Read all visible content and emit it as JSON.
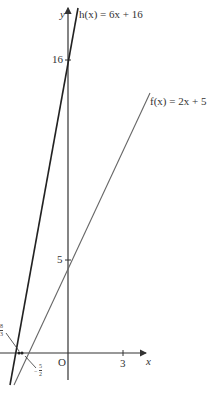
{
  "figure": {
    "axes": {
      "x_label": "x",
      "y_label": "y",
      "origin_label": "O",
      "x_ticks": [
        {
          "value": 3,
          "label": "3"
        }
      ],
      "y_ticks": [
        {
          "value": 5,
          "label": "5"
        },
        {
          "value": 16,
          "label": "16"
        }
      ]
    },
    "lines": [
      {
        "name": "h",
        "label": "h(x) = 6x + 16",
        "slope": 6,
        "intercept": 16,
        "color": "#222222"
      },
      {
        "name": "f",
        "label": "f(x) = 2x + 5",
        "slope": 2,
        "intercept": 5,
        "color": "#666666"
      }
    ],
    "annotations": [
      {
        "label": "−8/3",
        "num": "8",
        "den": "3",
        "sign": "−",
        "meaning": "x-intercept of h"
      },
      {
        "label": "−5/2",
        "num": "5",
        "den": "2",
        "sign": "−",
        "meaning": "x-intercept of f"
      }
    ],
    "colors": {
      "axis": "#333333",
      "h_line": "#222222",
      "f_line": "#666666"
    }
  },
  "labels": {
    "h": "h(x) = 6x + 16",
    "f": "f(x) = 2x + 5",
    "y_axis": "y",
    "x_axis": "x",
    "origin": "O",
    "tick_3": "3",
    "tick_5": "5",
    "tick_16": "16",
    "int_h_sign": "−",
    "int_h_num": "8",
    "int_h_den": "3",
    "int_f_sign": "−",
    "int_f_num": "5",
    "int_f_den": "2"
  }
}
